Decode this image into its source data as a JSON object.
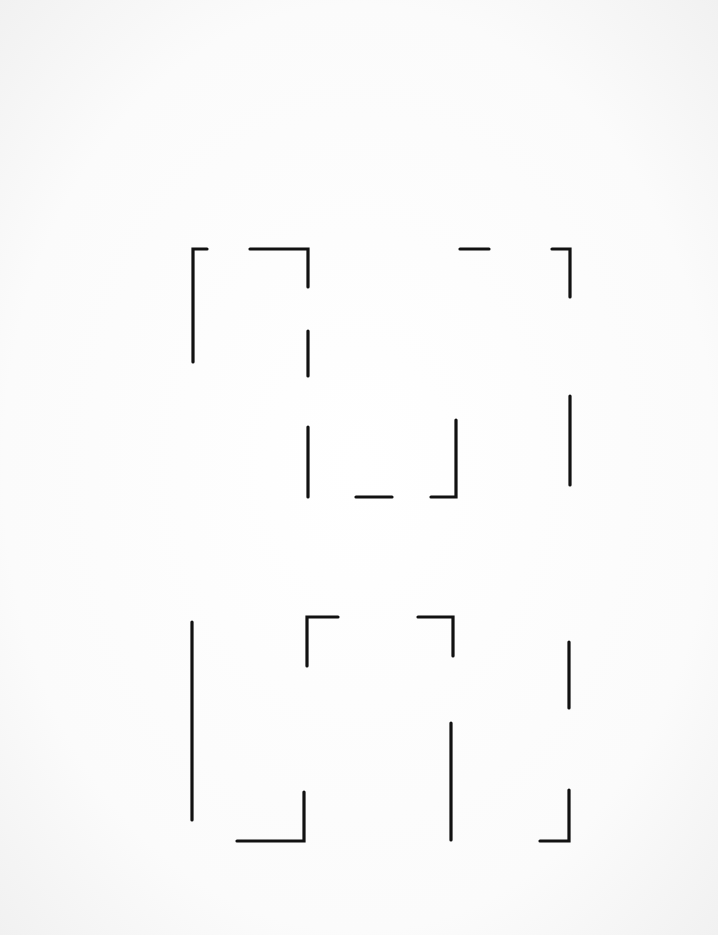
{
  "canvas": {
    "width": 718,
    "height": 935,
    "background": "#fdfdfd",
    "stroke": "#111111"
  },
  "figures": [
    {
      "name": "top-figure",
      "paths": [
        "M207,249 L193,249 L193,362",
        "M250,249 L308,249 L308,287",
        "M308,331 L308,376",
        "M308,427 L308,497",
        "M356,497 L392,497",
        "M431,497 L456,497 L456,420",
        "M460,249 L489,249",
        "M552,249 L570,249 L570,297",
        "M570,396 L570,485"
      ]
    },
    {
      "name": "bottom-figure",
      "paths": [
        "M192,622 L192,820",
        "M338,617 L307,617 L307,666",
        "M418,617 L453,617 L453,656",
        "M237,841 L304,841 L304,792",
        "M451,723 L451,840",
        "M569,642 L569,708",
        "M540,841 L569,841 L569,790"
      ]
    }
  ]
}
